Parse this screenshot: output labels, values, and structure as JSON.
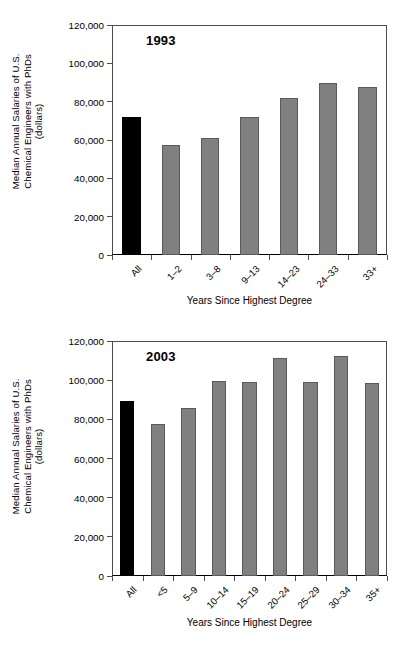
{
  "figure": {
    "y_axis_title": "Median Annual Salaries of U.S.\nChemical Engineers with PhDs\n(dollars)",
    "x_axis_title": "Years Since Highest Degree",
    "colors": {
      "all_bar": "#000000",
      "group_bar": "#808080",
      "axis": "#4d4d4d"
    }
  },
  "chart_data": [
    {
      "type": "bar",
      "title": "1993",
      "xlabel": "Years Since Highest Degree",
      "ylabel": "Median Annual Salaries of U.S. Chemical Engineers with PhDs (dollars)",
      "ylim": [
        0,
        120000
      ],
      "ytick_labels": [
        "0",
        "20,000",
        "40,000",
        "60,000",
        "80,000",
        "100,000",
        "120,000"
      ],
      "ytick_values": [
        0,
        20000,
        40000,
        60000,
        80000,
        100000,
        120000
      ],
      "grid": false,
      "legend": "none",
      "categories": [
        "All",
        "1–2",
        "3–8",
        "9–13",
        "14–23",
        "24–33",
        "33+"
      ],
      "values": [
        72000,
        57500,
        61000,
        72000,
        82000,
        89500,
        87500
      ],
      "highlight_index": 0
    },
    {
      "type": "bar",
      "title": "2003",
      "xlabel": "Years Since Highest Degree",
      "ylabel": "Median Annual Salaries of U.S. Chemical Engineers with PhDs (dollars)",
      "ylim": [
        0,
        120000
      ],
      "ytick_labels": [
        "0",
        "20,000",
        "40,000",
        "60,000",
        "80,000",
        "100,000",
        "120,000"
      ],
      "ytick_values": [
        0,
        20000,
        40000,
        60000,
        80000,
        100000,
        120000
      ],
      "grid": false,
      "legend": "none",
      "categories": [
        "All",
        "<5",
        "5–9",
        "10–14",
        "15–19",
        "20–24",
        "25–29",
        "30–34",
        "35+"
      ],
      "values": [
        89500,
        77500,
        86000,
        99500,
        99000,
        111500,
        99000,
        112500,
        98500
      ],
      "highlight_index": 0
    }
  ]
}
